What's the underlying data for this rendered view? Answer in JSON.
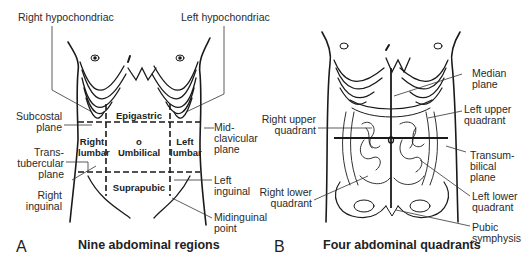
{
  "panels": [
    {
      "letter": "A",
      "caption": "Nine abdominal regions",
      "labels": {
        "right_hypochondriac": "Right hypochondriac",
        "left_hypochondriac": "Left hypochondriac",
        "subcostal_plane_1": "Subcostal",
        "subcostal_plane_2": "plane",
        "midclavicular_1": "Mid-",
        "midclavicular_2": "clavicular",
        "midclavicular_3": "plane",
        "transtubercular_1": "Trans-",
        "transtubercular_2": "tubercular",
        "transtubercular_3": "plane",
        "left_inguinal_1": "Left",
        "left_inguinal_2": "inguinal",
        "right_inguinal_1": "Right",
        "right_inguinal_2": "inguinal",
        "midinguinal_1": "Midinguinal",
        "midinguinal_2": "point"
      },
      "regions": {
        "epigastric": "Epigastric",
        "right_lumbar_1": "Right",
        "right_lumbar_2": "lumbar",
        "umbilical_symbol": "o",
        "umbilical": "Umbilical",
        "left_lumbar_1": "Left",
        "left_lumbar_2": "lumbar",
        "suprapubic": "Suprapubic"
      }
    },
    {
      "letter": "B",
      "caption": "Four abdominal quadrants",
      "labels": {
        "median_plane_1": "Median",
        "median_plane_2": "plane",
        "right_upper_1": "Right upper",
        "right_upper_2": "quadrant",
        "left_upper_1": "Left upper",
        "left_upper_2": "quadrant",
        "transumbilical_1": "Transum-",
        "transumbilical_2": "bilical",
        "transumbilical_3": "plane",
        "right_lower_1": "Right lower",
        "right_lower_2": "quadrant",
        "left_lower_1": "Left lower",
        "left_lower_2": "quadrant",
        "pubic_1": "Pubic",
        "pubic_2": "symphysis"
      }
    }
  ],
  "colors": {
    "line": "#1a1a1a",
    "leader": "#333333",
    "background": "#ffffff"
  }
}
